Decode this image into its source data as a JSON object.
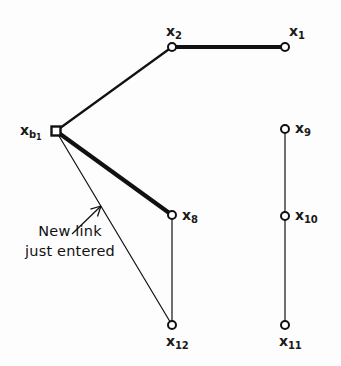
{
  "figure": {
    "background_color": "#fdfdfd",
    "ink_color": "#111111"
  },
  "annotation": {
    "line1": "New link",
    "line2": "just entered",
    "arrow": {
      "name": "callout-arrow",
      "from_x": 72,
      "from_y": 234,
      "to_x": 101,
      "to_y": 206
    }
  },
  "nodes": [
    {
      "id": "x1",
      "label_base": "x",
      "label_sub": "1",
      "x": 285,
      "y": 47,
      "marker": "circle",
      "label_dx": 4,
      "label_dy": -23
    },
    {
      "id": "x2",
      "label_base": "x",
      "label_sub": "2",
      "x": 172,
      "y": 47,
      "marker": "circle",
      "label_dx": -6,
      "label_dy": -23
    },
    {
      "id": "xb1",
      "label_base": "x",
      "label_sub": "b",
      "label_subsub": "1",
      "x": 56,
      "y": 131,
      "marker": "square",
      "label_dx": -36,
      "label_dy": -8
    },
    {
      "id": "x8",
      "label_base": "x",
      "label_sub": "8",
      "x": 172,
      "y": 215,
      "marker": "circle",
      "label_dx": 10,
      "label_dy": -7
    },
    {
      "id": "x9",
      "label_base": "x",
      "label_sub": "9",
      "x": 285,
      "y": 129,
      "marker": "circle",
      "label_dx": 10,
      "label_dy": -8
    },
    {
      "id": "x10",
      "label_base": "x",
      "label_sub": "10",
      "x": 285,
      "y": 216,
      "marker": "circle",
      "label_dx": 10,
      "label_dy": -8
    },
    {
      "id": "x11",
      "label_base": "x",
      "label_sub": "11",
      "x": 285,
      "y": 325,
      "marker": "circle",
      "label_dx": -6,
      "label_dy": 9
    },
    {
      "id": "x12",
      "label_base": "x",
      "label_sub": "12",
      "x": 172,
      "y": 325,
      "marker": "circle",
      "label_dx": -6,
      "label_dy": 9
    }
  ],
  "links": [
    {
      "id": "x2-x1",
      "from": "x2",
      "to": "x1",
      "style": "thick",
      "width": 4.2
    },
    {
      "id": "xb1-x2",
      "from": "xb1",
      "to": "x2",
      "style": "medium",
      "width": 2.2
    },
    {
      "id": "xb1-x8",
      "from": "xb1",
      "to": "x8",
      "style": "thick",
      "width": 4.2,
      "highlight": "new-link"
    },
    {
      "id": "xb1-x12",
      "from": "xb1",
      "to": "x12",
      "style": "thin",
      "width": 1.2
    },
    {
      "id": "x8-x12",
      "from": "x8",
      "to": "x12",
      "style": "thin",
      "width": 1.2
    },
    {
      "id": "x9-x10",
      "from": "x9",
      "to": "x10",
      "style": "thin",
      "width": 1.2
    },
    {
      "id": "x10-x11",
      "from": "x10",
      "to": "x11",
      "style": "thin",
      "width": 1.2
    }
  ]
}
